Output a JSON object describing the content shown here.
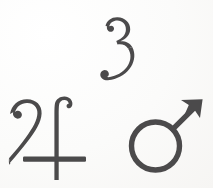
{
  "page": {
    "background_color": "#fdfdfc",
    "ink_color": "#4b4a4b",
    "width": 213,
    "height": 188
  },
  "glyphs": [
    {
      "id": "numeral-three",
      "name": "numeral-three-glyph",
      "label": "3",
      "character": "3",
      "meaning": "Numeral three",
      "style": "ornate old-style italic numeral with curled terminals",
      "position": "top center",
      "color": "#4b4a4b"
    },
    {
      "id": "jupiter",
      "name": "jupiter-symbol-glyph",
      "label": "♃",
      "character": "♃",
      "meaning": "Jupiter",
      "style": "calligraphic hooked stroke with crossbar",
      "position": "bottom left",
      "color": "#4b4a4b"
    },
    {
      "id": "mars",
      "name": "mars-symbol-glyph",
      "label": "♂",
      "character": "♂",
      "meaning": "Mars",
      "style": "circle with barbed arrow pointing upper right",
      "position": "bottom right",
      "color": "#4b4a4b"
    }
  ]
}
